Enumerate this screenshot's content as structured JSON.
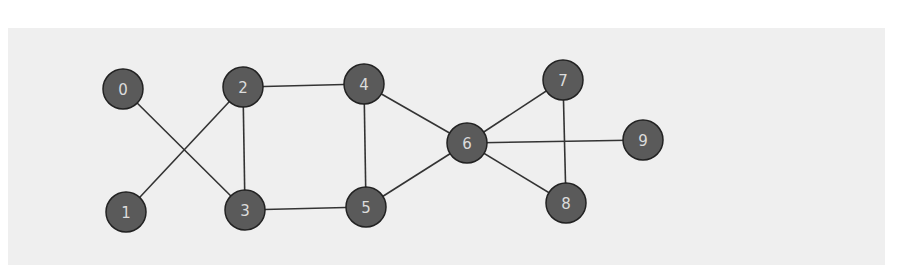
{
  "diagram": {
    "type": "undirected-graph",
    "colors": {
      "background": "#ffffff",
      "panel": "#efefef",
      "node_fill": "#5a5a5a",
      "node_stroke": "#222222",
      "node_label": "#dcdcdc",
      "edge": "#333333"
    },
    "node_radius": 20,
    "nodes": [
      {
        "id": "0",
        "label": "0",
        "x": 123,
        "y": 89
      },
      {
        "id": "1",
        "label": "1",
        "x": 126,
        "y": 212
      },
      {
        "id": "2",
        "label": "2",
        "x": 243,
        "y": 87
      },
      {
        "id": "3",
        "label": "3",
        "x": 245,
        "y": 210
      },
      {
        "id": "4",
        "label": "4",
        "x": 364,
        "y": 84
      },
      {
        "id": "5",
        "label": "5",
        "x": 366,
        "y": 207
      },
      {
        "id": "6",
        "label": "6",
        "x": 467,
        "y": 143
      },
      {
        "id": "7",
        "label": "7",
        "x": 563,
        "y": 80
      },
      {
        "id": "8",
        "label": "8",
        "x": 566,
        "y": 203
      },
      {
        "id": "9",
        "label": "9",
        "x": 643,
        "y": 140
      }
    ],
    "edges": [
      [
        "0",
        "3"
      ],
      [
        "1",
        "2"
      ],
      [
        "2",
        "3"
      ],
      [
        "2",
        "4"
      ],
      [
        "3",
        "5"
      ],
      [
        "4",
        "5"
      ],
      [
        "4",
        "6"
      ],
      [
        "5",
        "6"
      ],
      [
        "6",
        "7"
      ],
      [
        "6",
        "8"
      ],
      [
        "6",
        "9"
      ],
      [
        "7",
        "8"
      ]
    ]
  }
}
